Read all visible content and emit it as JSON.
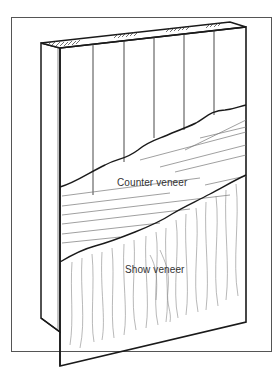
{
  "figure": {
    "labels": {
      "counter_veneer": "Counter veneer",
      "show_veneer": "Show veneer"
    },
    "colors": {
      "line": "#1a1a1a",
      "grain": "#777777",
      "background": "#ffffff"
    }
  }
}
